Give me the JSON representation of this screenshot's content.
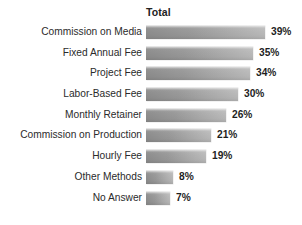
{
  "chart_data": {
    "type": "bar",
    "orientation": "horizontal",
    "title": "",
    "xlabel": "",
    "ylabel": "",
    "series_header": "Total",
    "value_suffix": "%",
    "xlim": [
      0,
      39
    ],
    "grid": false,
    "legend": "none",
    "bar_color": "#9a9a9a",
    "label_color": "#2b2b2b",
    "value_color": "#1e1e1e",
    "background": "#ffffff",
    "categories": [
      "Commission on Media",
      "Fixed Annual Fee",
      "Project Fee",
      "Labor-Based Fee",
      "Monthly Retainer",
      "Commission on Production",
      "Hourly Fee",
      "Other Methods",
      "No Answer"
    ],
    "values": [
      39,
      35,
      34,
      30,
      26,
      21,
      19,
      8,
      7
    ],
    "value_labels": [
      "39%",
      "35%",
      "34%",
      "30%",
      "26%",
      "21%",
      "19%",
      "8%",
      "7%"
    ]
  }
}
